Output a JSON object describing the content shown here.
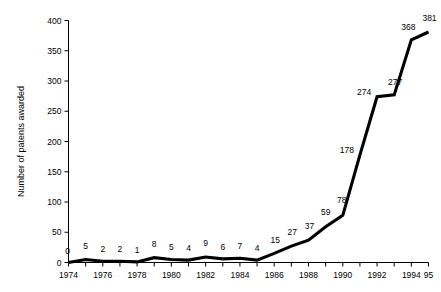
{
  "top_strip": {
    "clipped_text": "                     "
  },
  "chart_data": {
    "type": "line",
    "title": "",
    "xlabel": "",
    "ylabel": "Number of patents awarded",
    "x": [
      1974,
      1975,
      1976,
      1977,
      1978,
      1979,
      1980,
      1981,
      1982,
      1983,
      1984,
      1985,
      1986,
      1987,
      1988,
      1989,
      1990,
      1991,
      1992,
      1993,
      1994,
      1995
    ],
    "values": [
      0,
      5,
      2,
      2,
      1,
      8,
      5,
      4,
      9,
      6,
      7,
      4,
      15,
      27,
      37,
      59,
      78,
      178,
      274,
      277,
      368,
      381
    ],
    "point_labels": [
      "0",
      "5",
      "2",
      "2",
      "1",
      "8",
      "5",
      "4",
      "9",
      "6",
      "7",
      "4",
      "15",
      "27",
      "37",
      "59",
      "78",
      "178",
      "274",
      "277",
      "368",
      "381"
    ],
    "xlim": [
      1974,
      1995
    ],
    "ylim": [
      0,
      400
    ],
    "ytick_values": [
      0,
      50,
      100,
      150,
      200,
      250,
      300,
      350,
      400
    ],
    "ytick_labels": [
      "0",
      "50",
      "100",
      "150",
      "200",
      "250",
      "300",
      "350",
      "400"
    ],
    "xtick_values": [
      1974,
      1975,
      1976,
      1977,
      1978,
      1979,
      1980,
      1981,
      1982,
      1983,
      1984,
      1985,
      1986,
      1987,
      1988,
      1989,
      1990,
      1991,
      1992,
      1993,
      1994,
      1995
    ],
    "xtick_labels": [
      "1974",
      "",
      "1976",
      "",
      "1978",
      "",
      "1980",
      "",
      "1982",
      "",
      "1984",
      "",
      "1986",
      "",
      "1988",
      "",
      "1990",
      "",
      "1992",
      "",
      "1994",
      "95"
    ],
    "grid": false,
    "legend": null,
    "line_color": "#000000",
    "background_color": "#ffffff"
  }
}
